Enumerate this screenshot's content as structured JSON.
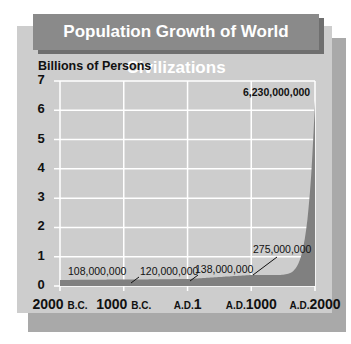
{
  "title": "Population Growth of World Civilizations",
  "colors": {
    "banner": "#8a8a8a",
    "panel": "#cdcdcd",
    "shadow": "#a9a9a9",
    "area_fill": "#808080",
    "gridline": "#ffffff"
  },
  "chart_data": {
    "type": "area",
    "title": "Population Growth of World Civilizations",
    "xlabel": "",
    "ylabel": "Billions of Persons",
    "ylim": [
      0,
      7
    ],
    "yticks": [
      "0",
      "1",
      "2",
      "3",
      "4",
      "5",
      "6",
      "7"
    ],
    "categories": [
      "2000 B.C.",
      "1000 B.C.",
      "A.D.1",
      "A.D.1000",
      "A.D.2000"
    ],
    "xtick_parts": [
      {
        "num": "2000",
        "era": "B.C.",
        "era_first": false
      },
      {
        "num": "1000",
        "era": "B.C.",
        "era_first": false
      },
      {
        "num": "1",
        "era": "A.D.",
        "era_first": true
      },
      {
        "num": "1000",
        "era": "A.D.",
        "era_first": true
      },
      {
        "num": "2000",
        "era": "A.D.",
        "era_first": true
      }
    ],
    "x": [
      -2000,
      -1000,
      1,
      1000,
      2000
    ],
    "values": [
      0.108,
      0.12,
      0.138,
      0.275,
      6.23
    ],
    "annotations": [
      {
        "x": -2000,
        "value": 108000000,
        "label": "108,000,000"
      },
      {
        "x": -1000,
        "value": 120000000,
        "label": "120,000,000"
      },
      {
        "x": 1,
        "value": 138000000,
        "label": "138,000,000"
      },
      {
        "x": 1000,
        "value": 275000000,
        "label": "275,000,000"
      },
      {
        "x": 2000,
        "value": 6230000000,
        "label": "6,230,000,000"
      }
    ],
    "grid": true,
    "legend": null
  }
}
